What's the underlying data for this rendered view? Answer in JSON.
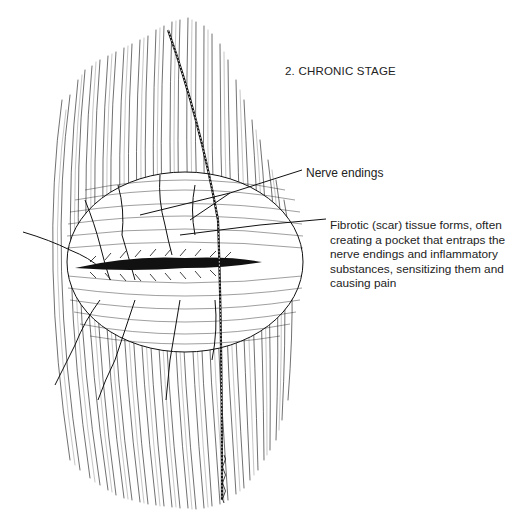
{
  "title": "2. CHRONIC STAGE",
  "annotations": {
    "nerve_endings": "Nerve endings",
    "fibrotic": {
      "lines": [
        "Fibrotic (scar) tissue forms, often",
        "creating a pocket that entraps the",
        "nerve endings and inflammatory",
        "substances, sensitizing them and",
        "causing pain"
      ]
    }
  },
  "illustration": {
    "subject": "muscle fibers with fibrotic scar pocket and entrapped nerve endings",
    "signature": "artist-signature"
  },
  "colors": {
    "ink": "#111111",
    "text": "#222222",
    "background": "#ffffff"
  }
}
